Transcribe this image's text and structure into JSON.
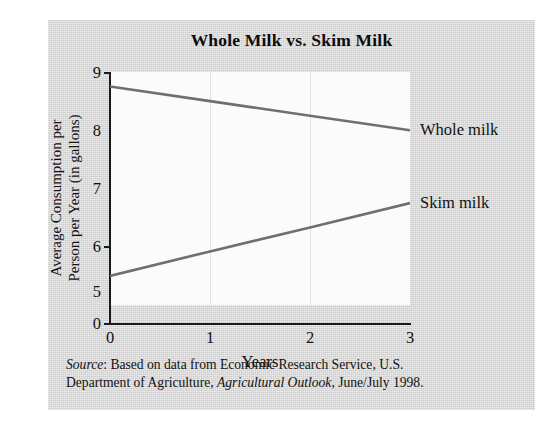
{
  "figure": {
    "title": "Whole Milk vs. Skim Milk",
    "source_prefix": "Source",
    "source_line1_rest": ": Based on data from Economic Research Service, U.S.",
    "source_line2_pre": "Department of Agriculture, ",
    "source_publication": "Agricultural Outlook",
    "source_line2_post": ", June/July 1998.",
    "panel_color": "#d6d6d6",
    "plot_color": "#fbfbfb",
    "line_color": "#6f6f6f",
    "axis_color": "#1a1a1a"
  },
  "chart_data": {
    "type": "line",
    "title": "Whole Milk vs. Skim Milk",
    "xlabel": "Years",
    "ylabel": "Average Consumption per Person per Year (in gallons)",
    "ylabel_line1": "Average Consumption per",
    "ylabel_line2": "Person per Year (in gallons)",
    "x": [
      0,
      1,
      2,
      3
    ],
    "xlim": [
      0,
      3
    ],
    "xticks": [
      0,
      1,
      2,
      3
    ],
    "xticklabels": [
      "0",
      "1",
      "2",
      "3"
    ],
    "ylim": [
      5,
      9
    ],
    "yticks": [
      9,
      8,
      7,
      6,
      5
    ],
    "yticklabels": [
      "9",
      "8",
      "7",
      "6",
      "5"
    ],
    "y_axis_break_label": "0",
    "grid": "vertical-only",
    "legend": "inline-right",
    "series": [
      {
        "name": "Whole milk",
        "label": "Whole milk",
        "color": "#6f6f6f",
        "values": [
          8.75,
          8.5,
          8.25,
          8.0
        ]
      },
      {
        "name": "Skim milk",
        "label": "Skim milk",
        "color": "#6f6f6f",
        "values": [
          5.5,
          5.92,
          6.33,
          6.75
        ]
      }
    ]
  }
}
